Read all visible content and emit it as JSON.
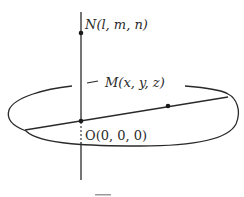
{
  "diagram": {
    "points": {
      "N": {
        "label": "N(l, m, n)",
        "name": "N",
        "coords": "(l, m, n)"
      },
      "M": {
        "label": "M(x, y, z)",
        "name": "M",
        "coords": "(x, y, z)"
      },
      "O": {
        "label": "O(0, 0, 0)",
        "name": "O",
        "coords": "(0, 0, 0)"
      }
    },
    "colors": {
      "stroke": "#2a2a2a",
      "background": "#ffffff"
    }
  }
}
